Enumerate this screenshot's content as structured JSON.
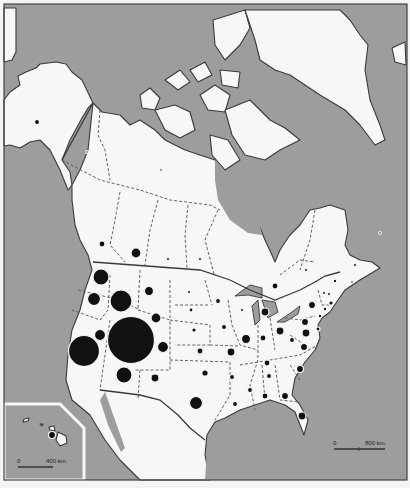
{
  "map": {
    "title": "North America proportional symbol map",
    "colors": {
      "water": "#9d9d9b",
      "land": "#f7f7f5",
      "symbol": "#111111",
      "border": "#3a3a3a"
    },
    "main_scale": {
      "start_label": "0",
      "end_label": "800 km."
    },
    "inset": {
      "name": "Hawaii inset",
      "scale_start_label": "0",
      "scale_end_label": "400 km."
    },
    "symbols": [
      {
        "region": "Alaska",
        "x": 37,
        "y": 122,
        "r": 2.5
      },
      {
        "region": "Yukon",
        "x": 87,
        "y": 152,
        "r": 1.3
      },
      {
        "region": "Northwest Territories",
        "x": 161,
        "y": 170,
        "r": 1.3
      },
      {
        "region": "British Columbia",
        "x": 102,
        "y": 244,
        "r": 3
      },
      {
        "region": "Alberta",
        "x": 136,
        "y": 253,
        "r": 5
      },
      {
        "region": "Saskatchewan",
        "x": 168,
        "y": 259,
        "r": 1.5
      },
      {
        "region": "Manitoba",
        "x": 200,
        "y": 259,
        "r": 1.5
      },
      {
        "region": "Ontario",
        "x": 275,
        "y": 286,
        "r": 3
      },
      {
        "region": "Quebec",
        "x": 306,
        "y": 270,
        "r": 1.5
      },
      {
        "region": "New Brunswick",
        "x": 335,
        "y": 281,
        "r": 2
      },
      {
        "region": "Nova Scotia",
        "x": 352,
        "y": 282,
        "r": 1.3
      },
      {
        "region": "Newfoundland",
        "x": 380,
        "y": 233,
        "r": 1.3
      },
      {
        "region": "Labrador",
        "x": 355,
        "y": 265,
        "r": 1.5
      },
      {
        "region": "Washington",
        "x": 101,
        "y": 277,
        "r": 8
      },
      {
        "region": "Oregon",
        "x": 94,
        "y": 299,
        "r": 6.5
      },
      {
        "region": "Idaho",
        "x": 121,
        "y": 301,
        "r": 11
      },
      {
        "region": "Montana",
        "x": 149,
        "y": 291,
        "r": 4.5
      },
      {
        "region": "Wyoming",
        "x": 156,
        "y": 318,
        "r": 5
      },
      {
        "region": "Nevada",
        "x": 100,
        "y": 335,
        "r": 5.5
      },
      {
        "region": "Utah",
        "x": 131,
        "y": 340,
        "r": 23.5
      },
      {
        "region": "California",
        "x": 84,
        "y": 351,
        "r": 15.5
      },
      {
        "region": "Colorado",
        "x": 163,
        "y": 347,
        "r": 5.5
      },
      {
        "region": "Arizona",
        "x": 124,
        "y": 375,
        "r": 8
      },
      {
        "region": "New Mexico",
        "x": 155,
        "y": 378,
        "r": 4
      },
      {
        "region": "North Dakota",
        "x": 189,
        "y": 292,
        "r": 1.5
      },
      {
        "region": "South Dakota",
        "x": 191,
        "y": 310,
        "r": 2
      },
      {
        "region": "Nebraska",
        "x": 194,
        "y": 330,
        "r": 2.2
      },
      {
        "region": "Kansas",
        "x": 200,
        "y": 351,
        "r": 3
      },
      {
        "region": "Oklahoma",
        "x": 205,
        "y": 373,
        "r": 3.2
      },
      {
        "region": "Texas",
        "x": 196,
        "y": 403,
        "r": 6.5
      },
      {
        "region": "Minnesota",
        "x": 218,
        "y": 301,
        "r": 2.5
      },
      {
        "region": "Iowa",
        "x": 224,
        "y": 327,
        "r": 2.5
      },
      {
        "region": "Missouri",
        "x": 231,
        "y": 352,
        "r": 4
      },
      {
        "region": "Arkansas",
        "x": 232,
        "y": 377,
        "r": 2.5
      },
      {
        "region": "Louisiana",
        "x": 235,
        "y": 404,
        "r": 2.5
      },
      {
        "region": "Wisconsin",
        "x": 242,
        "y": 310,
        "r": 1.5
      },
      {
        "region": "Illinois",
        "x": 246,
        "y": 339,
        "r": 4.5
      },
      {
        "region": "Michigan",
        "x": 265,
        "y": 312,
        "r": 4
      },
      {
        "region": "Indiana",
        "x": 263,
        "y": 338,
        "r": 3
      },
      {
        "region": "Ohio",
        "x": 280,
        "y": 331,
        "r": 4
      },
      {
        "region": "Kentucky",
        "x": 267,
        "y": 363,
        "r": 3
      },
      {
        "region": "Tennessee",
        "x": 269,
        "y": 376,
        "r": 2.5
      },
      {
        "region": "Mississippi",
        "x": 250,
        "y": 390,
        "r": 2.5
      },
      {
        "region": "Alabama",
        "x": 265,
        "y": 396,
        "r": 3
      },
      {
        "region": "Georgia",
        "x": 285,
        "y": 396,
        "r": 3.5
      },
      {
        "region": "Florida",
        "x": 302,
        "y": 416,
        "r": 4
      },
      {
        "region": "South Carolina",
        "x": 300,
        "y": 369,
        "r": 3.5
      },
      {
        "region": "North Carolina",
        "x": 304,
        "y": 347,
        "r": 3.5
      },
      {
        "region": "Virginia",
        "x": 306,
        "y": 333,
        "r": 4
      },
      {
        "region": "West Virginia",
        "x": 292,
        "y": 340,
        "r": 2.5
      },
      {
        "region": "Pennsylvania",
        "x": 305,
        "y": 322,
        "r": 3.5
      },
      {
        "region": "New York",
        "x": 312,
        "y": 305,
        "r": 3.5
      },
      {
        "region": "Vermont",
        "x": 324,
        "y": 293,
        "r": 1.5
      },
      {
        "region": "New Hampshire",
        "x": 329,
        "y": 294,
        "r": 1.5
      },
      {
        "region": "Maine",
        "x": 335,
        "y": 281,
        "r": 1.8
      },
      {
        "region": "Massachusetts",
        "x": 331,
        "y": 303,
        "r": 2.2
      },
      {
        "region": "Connecticut",
        "x": 325,
        "y": 309,
        "r": 1.8
      },
      {
        "region": "New Jersey",
        "x": 320,
        "y": 316,
        "r": 1.8
      },
      {
        "region": "Maryland",
        "x": 318,
        "y": 329,
        "r": 2
      },
      {
        "region": "Hawaii",
        "x": 52,
        "y": 435,
        "r": 3.5
      }
    ]
  }
}
